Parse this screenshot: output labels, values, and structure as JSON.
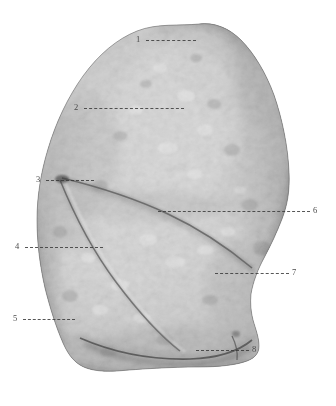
{
  "plate": {
    "width": 336,
    "height": 406,
    "background_color": "#ffffff",
    "medium": "halftone photographic plate, grayscale",
    "subject": "lung specimen, costal surface with oblique and horizontal fissures"
  },
  "specimen": {
    "tone_light": "#dcdcdc",
    "tone_mid": "#b4b4b4",
    "tone_dark": "#6e6e6e",
    "tone_shadow": "#4a4a4a",
    "outline_color": "#3c3c3c"
  },
  "labels": [
    {
      "id": "1",
      "text": "1",
      "x": 136,
      "y": 35,
      "side": "left",
      "leader": {
        "x": 146,
        "y": 40,
        "length": 50
      }
    },
    {
      "id": "2",
      "text": "2",
      "x": 74,
      "y": 103,
      "side": "left",
      "leader": {
        "x": 84,
        "y": 108,
        "length": 100
      }
    },
    {
      "id": "3",
      "text": "3",
      "x": 36,
      "y": 175,
      "side": "left",
      "leader": {
        "x": 46,
        "y": 180,
        "length": 48
      }
    },
    {
      "id": "4",
      "text": "4",
      "x": 15,
      "y": 242,
      "side": "left",
      "leader": {
        "x": 25,
        "y": 247,
        "length": 78
      }
    },
    {
      "id": "5",
      "text": "5",
      "x": 13,
      "y": 314,
      "side": "left",
      "leader": {
        "x": 23,
        "y": 319,
        "length": 52
      }
    },
    {
      "id": "6",
      "text": "6",
      "x": 313,
      "y": 206,
      "side": "right",
      "leader": {
        "x": 158,
        "y": 211,
        "length": 152
      }
    },
    {
      "id": "7",
      "text": "7",
      "x": 292,
      "y": 268,
      "side": "right",
      "leader": {
        "x": 215,
        "y": 273,
        "length": 74
      }
    },
    {
      "id": "8",
      "text": "8",
      "x": 252,
      "y": 345,
      "side": "right",
      "leader": {
        "x": 196,
        "y": 350,
        "length": 53
      }
    }
  ]
}
